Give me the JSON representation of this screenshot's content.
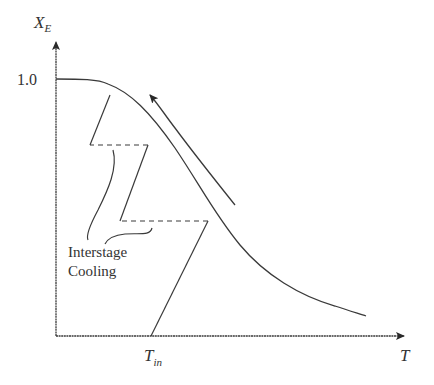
{
  "diagram": {
    "y_axis_label": "X",
    "y_axis_subscript": "E",
    "x_axis_label": "T",
    "y_tick_label": "1.0",
    "x_tick_label": "T",
    "x_tick_subscript": "in",
    "annotation_line1": "Interstage",
    "annotation_line2": "Cooling",
    "colors": {
      "line": "#3a3a3a",
      "text": "#333333",
      "background": "#ffffff"
    }
  }
}
